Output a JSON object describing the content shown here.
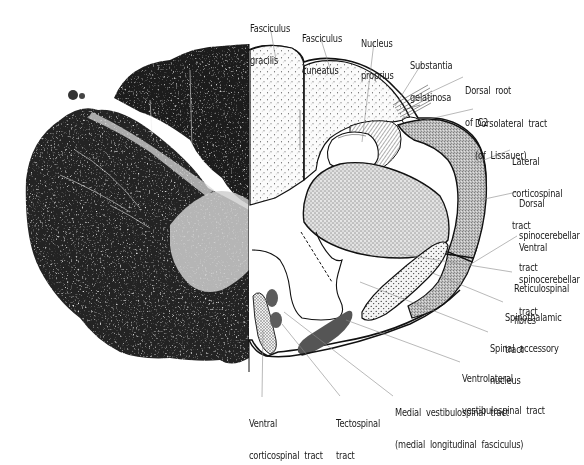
{
  "figure": {
    "left_half": "histological-section-photo",
    "right_half": "labelled-schematic"
  },
  "labels": [
    {
      "id": "fasciculus-gracilis",
      "lines": [
        "Fasciculus",
        "gracilis"
      ],
      "x": 250,
      "y": 3
    },
    {
      "id": "fasciculus-cuneatus",
      "lines": [
        "Fasciculus",
        "cuneatus"
      ],
      "x": 302,
      "y": 13
    },
    {
      "id": "nucleus-proprius",
      "lines": [
        "Nucleus",
        "proprius"
      ],
      "x": 361,
      "y": 18
    },
    {
      "id": "substantia-gelatinosa",
      "lines": [
        "Substantia",
        "gelatinosa"
      ],
      "x": 410,
      "y": 40
    },
    {
      "id": "dorsal-root-c2",
      "lines": [
        "Dorsal  root",
        "of  C2"
      ],
      "x": 465,
      "y": 65
    },
    {
      "id": "dorsolateral-tract",
      "lines": [
        "Dorsolateral  tract",
        "(of  Lissauer)"
      ],
      "x": 475,
      "y": 98
    },
    {
      "id": "lateral-corticospinal-tract",
      "lines": [
        "Lateral",
        "corticospinal",
        "tract"
      ],
      "x": 512,
      "y": 136
    },
    {
      "id": "dorsal-spinocerebellar-tract",
      "lines": [
        "Dorsal",
        "spinocerebellar",
        "tract"
      ],
      "x": 519,
      "y": 178
    },
    {
      "id": "ventral-spinocerebellar-tract",
      "lines": [
        "Ventral",
        "spinocerebellar",
        "tract"
      ],
      "x": 519,
      "y": 222
    },
    {
      "id": "reticulospinal-fibres",
      "lines": [
        "Reticulospinal",
        "fibres"
      ],
      "x": 514,
      "y": 263
    },
    {
      "id": "spinothalamic-tract",
      "lines": [
        "Spinothalamic",
        "tract"
      ],
      "x": 505,
      "y": 292
    },
    {
      "id": "spinal-accessory-nucleus",
      "lines": [
        "Spinal  accessory",
        "nucleus"
      ],
      "x": 490,
      "y": 323
    },
    {
      "id": "ventrolateral-vestibulospinal-tract",
      "lines": [
        "Ventrolateral",
        "vestibulospinal  tract"
      ],
      "x": 462,
      "y": 353
    },
    {
      "id": "medial-vestibulospinal-tract",
      "lines": [
        "Medial  vestibulospinal  tract",
        "(medial  longitudinal  fasciculus)"
      ],
      "x": 395,
      "y": 387
    },
    {
      "id": "tectospinal-tract",
      "lines": [
        "Tectospinal",
        "tract"
      ],
      "x": 336,
      "y": 398
    },
    {
      "id": "ventral-corticospinal-tract",
      "lines": [
        "Ventral",
        "corticospinal  tract"
      ],
      "x": 249,
      "y": 398
    }
  ],
  "colors": {
    "outline": "#111111",
    "leader": "#8a8a8a",
    "dense_tract": "#555555",
    "photo_dark": "#1c1c1c",
    "photo_light": "#d9d9d9"
  }
}
